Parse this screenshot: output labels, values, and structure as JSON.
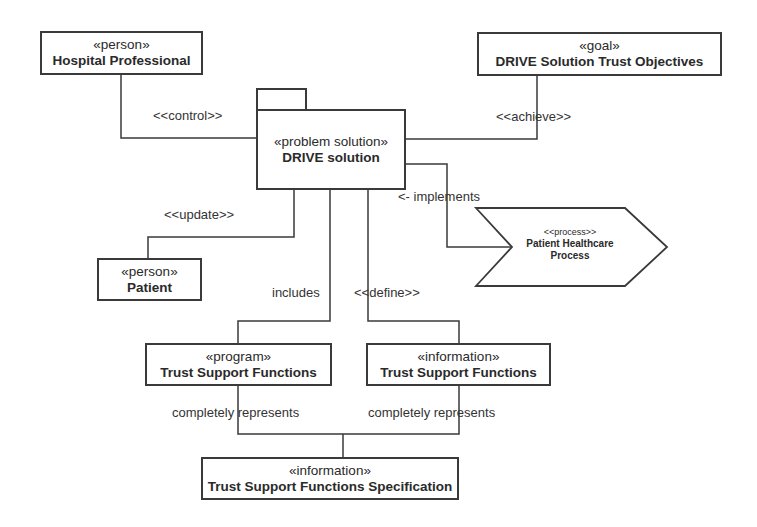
{
  "diagram": {
    "type": "UML stereotyped model diagram",
    "nodes": {
      "hospital_professional": {
        "stereotype": "«person»",
        "name": "Hospital Professional"
      },
      "trust_objectives": {
        "stereotype": "«goal»",
        "name": "DRIVE Solution Trust Objectives"
      },
      "drive_solution": {
        "stereotype": "«problem solution»",
        "name": "DRIVE solution",
        "shape": "package"
      },
      "patient_process": {
        "stereotype": "<<process>>",
        "name_line1": "Patient Healthcare",
        "name_line2": "Process",
        "shape": "chevron"
      },
      "patient": {
        "stereotype": "«person»",
        "name": "Patient"
      },
      "program_tsf": {
        "stereotype": "«program»",
        "name": "Trust Support Functions"
      },
      "information_tsf": {
        "stereotype": "«information»",
        "name": "Trust Support Functions"
      },
      "tsf_spec": {
        "stereotype": "«information»",
        "name": "Trust Support Functions Specification"
      }
    },
    "edges": {
      "control": {
        "label": "<<control>>",
        "from": "Hospital Professional",
        "to": "DRIVE solution"
      },
      "achieve": {
        "label": "<<achieve>>",
        "from": "DRIVE solution",
        "to": "DRIVE Solution Trust Objectives"
      },
      "implements": {
        "label": "<- implements",
        "from": "DRIVE solution",
        "to": "Patient Healthcare Process"
      },
      "update": {
        "label": "<<update>>",
        "from": "DRIVE solution",
        "to": "Patient"
      },
      "includes": {
        "label": "includes",
        "from": "DRIVE solution",
        "to": "«program» Trust Support Functions"
      },
      "define": {
        "label": "<<define>>",
        "from": "DRIVE solution",
        "to": "«information» Trust Support Functions"
      },
      "represents_left": {
        "label": "completely represents",
        "from": "«program» Trust Support Functions",
        "to": "Trust Support Functions Specification"
      },
      "represents_right": {
        "label": "completely represents",
        "from": "«information» Trust Support Functions",
        "to": "Trust Support Functions Specification"
      }
    },
    "colors": {
      "line": "#3a3a3a",
      "background": "#ffffff",
      "text": "#2a2a2a"
    }
  }
}
